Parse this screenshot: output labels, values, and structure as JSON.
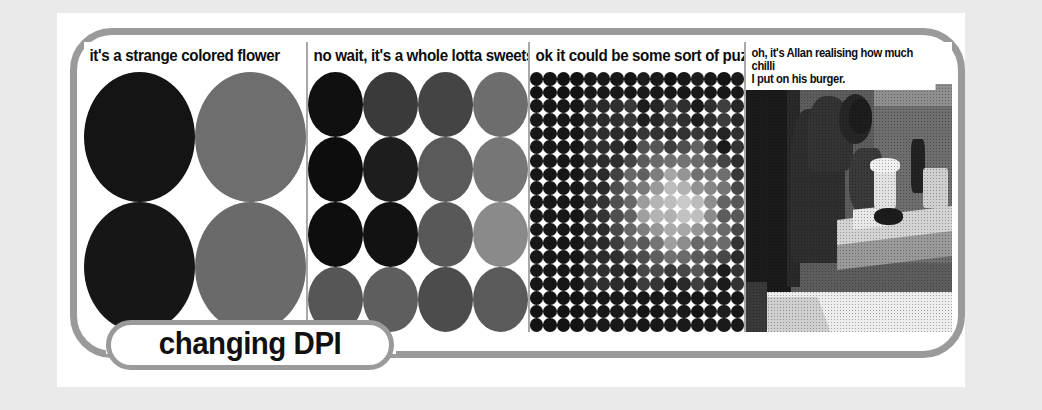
{
  "slide": {
    "title_label": "changing DPI",
    "background_color": "#eaeaea",
    "sheet_color": "#ffffff",
    "frame_color": "#9a9a9a",
    "divider_color": "#a8a8a8"
  },
  "panels": [
    {
      "id": "panel-flower",
      "caption": "it's a strange colored flower",
      "art_type": "circles-2x2",
      "columns": 2,
      "rows": 2,
      "colors": [
        [
          "#141414",
          "#6e6e6e"
        ],
        [
          "#161616",
          "#6a6a6a"
        ]
      ]
    },
    {
      "id": "panel-sweets",
      "caption": "no wait, it's a whole lotta sweets",
      "art_type": "circles-4x4",
      "columns": 4,
      "rows": 4,
      "colors": [
        [
          "#101010",
          "#3a3a3a",
          "#444444",
          "#6d6d6d"
        ],
        [
          "#0d0d0d",
          "#1d1d1d",
          "#5a5a5a",
          "#767676"
        ],
        [
          "#0e0e0e",
          "#121212",
          "#585858",
          "#8a8a8a"
        ],
        [
          "#565656",
          "#5e5e5e",
          "#4c4c4c",
          "#5a5a5a"
        ]
      ]
    },
    {
      "id": "panel-puzzle",
      "caption": "ok it could be some sort of puzzle",
      "art_type": "halftone-dot-grid",
      "columns": 16,
      "rows": 19
    },
    {
      "id": "panel-photo",
      "caption_lines": [
        "oh, it's Allan realising how much chilli",
        "I put on his burger."
      ],
      "art_type": "photograph",
      "subject": "person leaning over a desk with papers and a food container"
    }
  ]
}
